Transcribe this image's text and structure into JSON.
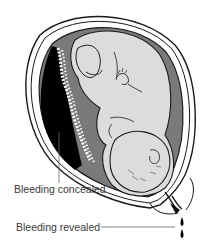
{
  "figure": {
    "labels": {
      "concealed": "Bleeding concealed",
      "revealed": "Bleeding revealed"
    },
    "colors": {
      "outline": "#1a1a1a",
      "fetus": "#dcdcdc",
      "amniotic_fluid": "#7a7a7a",
      "concealed_blood": "#000000",
      "uterine_wall": "#ffffff",
      "label_text": "#3a3a3a",
      "leader_line": "#6a6a6a"
    }
  }
}
